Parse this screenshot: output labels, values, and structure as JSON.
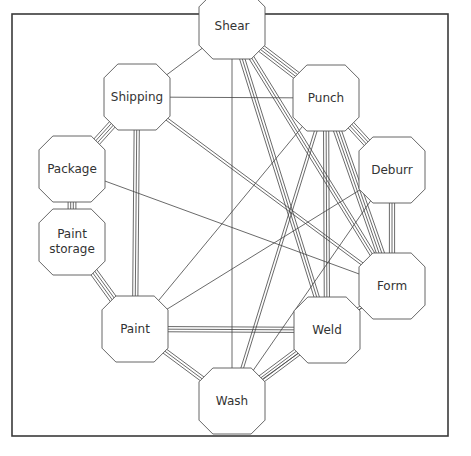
{
  "diagram": {
    "type": "activity-relationship-network",
    "nodes": [
      {
        "id": "shear",
        "label": "Shear",
        "lines": [
          "Shear"
        ],
        "x": 232,
        "y": 26
      },
      {
        "id": "shipping",
        "label": "Shipping",
        "lines": [
          "Shipping"
        ],
        "x": 137,
        "y": 97
      },
      {
        "id": "punch",
        "label": "Punch",
        "lines": [
          "Punch"
        ],
        "x": 326,
        "y": 98
      },
      {
        "id": "package",
        "label": "Package",
        "lines": [
          "Package"
        ],
        "x": 72,
        "y": 169
      },
      {
        "id": "deburr",
        "label": "Deburr",
        "lines": [
          "Deburr"
        ],
        "x": 392,
        "y": 170
      },
      {
        "id": "paint-storage",
        "label": "Paint storage",
        "lines": [
          "Paint",
          "storage"
        ],
        "x": 72,
        "y": 242
      },
      {
        "id": "form",
        "label": "Form",
        "lines": [
          "Form"
        ],
        "x": 392,
        "y": 286
      },
      {
        "id": "paint",
        "label": "Paint",
        "lines": [
          "Paint"
        ],
        "x": 135,
        "y": 329
      },
      {
        "id": "weld",
        "label": "Weld",
        "lines": [
          "Weld"
        ],
        "x": 327,
        "y": 330
      },
      {
        "id": "wash",
        "label": "Wash",
        "lines": [
          "Wash"
        ],
        "x": 232,
        "y": 401
      }
    ],
    "edges": [
      {
        "from": "shear",
        "to": "punch",
        "lines": 4
      },
      {
        "from": "shear",
        "to": "shipping",
        "lines": 1
      },
      {
        "from": "shear",
        "to": "wash",
        "lines": 1
      },
      {
        "from": "shear",
        "to": "form",
        "lines": 3
      },
      {
        "from": "shear",
        "to": "weld",
        "lines": 3
      },
      {
        "from": "shipping",
        "to": "package",
        "lines": 4
      },
      {
        "from": "shipping",
        "to": "paint",
        "lines": 3
      },
      {
        "from": "shipping",
        "to": "form",
        "lines": 2
      },
      {
        "from": "shipping",
        "to": "punch",
        "lines": 1
      },
      {
        "from": "punch",
        "to": "deburr",
        "lines": 4
      },
      {
        "from": "punch",
        "to": "form",
        "lines": 4
      },
      {
        "from": "punch",
        "to": "weld",
        "lines": 3
      },
      {
        "from": "punch",
        "to": "wash",
        "lines": 2
      },
      {
        "from": "punch",
        "to": "paint",
        "lines": 1
      },
      {
        "from": "package",
        "to": "paint-storage",
        "lines": 4
      },
      {
        "from": "package",
        "to": "form",
        "lines": 1
      },
      {
        "from": "deburr",
        "to": "form",
        "lines": 3
      },
      {
        "from": "deburr",
        "to": "paint",
        "lines": 1
      },
      {
        "from": "deburr",
        "to": "wash",
        "lines": 1
      },
      {
        "from": "paint-storage",
        "to": "paint",
        "lines": 4
      },
      {
        "from": "form",
        "to": "weld",
        "lines": 2
      },
      {
        "from": "form",
        "to": "wash",
        "lines": 1
      },
      {
        "from": "paint",
        "to": "weld",
        "lines": 3
      },
      {
        "from": "paint",
        "to": "wash",
        "lines": 3
      },
      {
        "from": "weld",
        "to": "wash",
        "lines": 4
      }
    ]
  },
  "style": {
    "line_color": "#444444",
    "node_stroke": "#555555",
    "node_fill": "#ffffff",
    "frame_color": "#3a3a3a"
  }
}
